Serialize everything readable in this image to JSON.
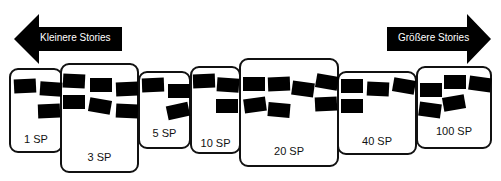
{
  "arrows": {
    "left": {
      "label": "Kleinere Stories",
      "direction": "left"
    },
    "right": {
      "label": "Größere Stories",
      "direction": "right"
    }
  },
  "buckets": [
    {
      "label": "1 SP",
      "cards": 3
    },
    {
      "label": "3 SP",
      "cards": 6
    },
    {
      "label": "5 SP",
      "cards": 3
    },
    {
      "label": "10 SP",
      "cards": 3
    },
    {
      "label": "20 SP",
      "cards": 7
    },
    {
      "label": "40 SP",
      "cards": 4
    },
    {
      "label": "100 SP",
      "cards": 5
    }
  ],
  "colors": {
    "ink": "#000000",
    "background": "#ffffff",
    "arrow_text": "#ffffff"
  }
}
